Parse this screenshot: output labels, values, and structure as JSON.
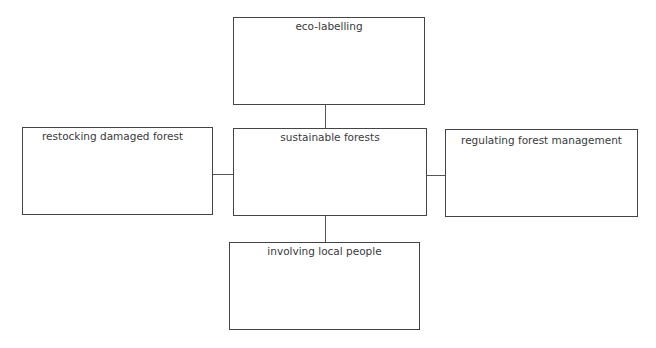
{
  "diagram": {
    "type": "spider-diagram",
    "center": {
      "id": "center",
      "label": "sustainable forests"
    },
    "nodes": [
      {
        "id": "top",
        "label": "eco-labelling",
        "position": "top"
      },
      {
        "id": "left",
        "label": "restocking damaged forest",
        "position": "left"
      },
      {
        "id": "right",
        "label": "regulating forest management",
        "position": "right"
      },
      {
        "id": "bottom",
        "label": "involving local people",
        "position": "bottom"
      }
    ],
    "edges": [
      {
        "from": "center",
        "to": "top"
      },
      {
        "from": "center",
        "to": "left"
      },
      {
        "from": "center",
        "to": "right"
      },
      {
        "from": "center",
        "to": "bottom"
      }
    ],
    "colors": {
      "border": "#444444",
      "text": "#3a3a3a",
      "background": "#ffffff"
    }
  }
}
